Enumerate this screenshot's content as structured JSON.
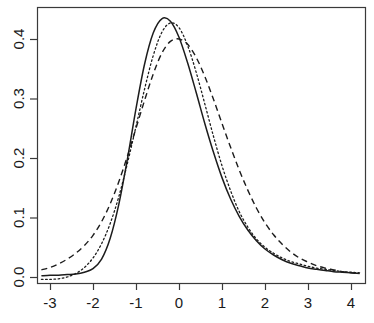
{
  "chart_data": {
    "type": "line",
    "title": "",
    "subtitle": "",
    "xlabel": "",
    "ylabel": "",
    "xlim": [
      -3.2,
      4.2
    ],
    "ylim": [
      -0.012,
      0.452
    ],
    "grid": false,
    "legend": null,
    "x_ticks": [
      "-3",
      "-2",
      "-1",
      "0",
      "1",
      "2",
      "3",
      "4"
    ],
    "x_tick_values": [
      -3,
      -2,
      -1,
      0,
      1,
      2,
      3,
      4
    ],
    "y_ticks": [
      "0.0",
      "0.1",
      "0.2",
      "0.3",
      "0.4"
    ],
    "y_tick_values": [
      0.0,
      0.1,
      0.2,
      0.3,
      0.4
    ],
    "x": [
      -3.2,
      -3.0,
      -2.8,
      -2.6,
      -2.4,
      -2.2,
      -2.0,
      -1.8,
      -1.6,
      -1.4,
      -1.2,
      -1.0,
      -0.8,
      -0.6,
      -0.4,
      -0.2,
      0.0,
      0.2,
      0.4,
      0.6,
      0.8,
      1.0,
      1.2,
      1.4,
      1.6,
      1.8,
      2.0,
      2.2,
      2.4,
      2.6,
      2.8,
      3.0,
      3.2,
      3.4,
      3.6,
      3.8,
      4.0,
      4.2
    ],
    "series": [
      {
        "name": "solid-curve",
        "style": "solid",
        "color": "#1c1c1c",
        "values": [
          0.002,
          0.003,
          0.003,
          0.004,
          0.005,
          0.008,
          0.014,
          0.03,
          0.065,
          0.122,
          0.198,
          0.283,
          0.358,
          0.41,
          0.434,
          0.43,
          0.403,
          0.36,
          0.31,
          0.258,
          0.21,
          0.167,
          0.131,
          0.102,
          0.079,
          0.061,
          0.047,
          0.037,
          0.029,
          0.023,
          0.019,
          0.015,
          0.013,
          0.011,
          0.009,
          0.008,
          0.007,
          0.006
        ]
      },
      {
        "name": "dashed-curve",
        "style": "dashed",
        "color": "#1c1c1c",
        "values": [
          0.012,
          0.016,
          0.022,
          0.03,
          0.04,
          0.053,
          0.07,
          0.093,
          0.123,
          0.16,
          0.203,
          0.25,
          0.297,
          0.341,
          0.376,
          0.396,
          0.4,
          0.391,
          0.369,
          0.337,
          0.299,
          0.258,
          0.218,
          0.18,
          0.146,
          0.116,
          0.091,
          0.071,
          0.055,
          0.042,
          0.032,
          0.025,
          0.019,
          0.015,
          0.012,
          0.009,
          0.007,
          0.006
        ]
      },
      {
        "name": "dotted-curve",
        "style": "dotted",
        "color": "#1c1c1c",
        "values": [
          -0.004,
          -0.004,
          -0.003,
          0.0,
          0.006,
          0.016,
          0.032,
          0.056,
          0.09,
          0.135,
          0.191,
          0.253,
          0.316,
          0.372,
          0.411,
          0.427,
          0.419,
          0.389,
          0.344,
          0.291,
          0.237,
          0.187,
          0.145,
          0.11,
          0.084,
          0.064,
          0.05,
          0.04,
          0.032,
          0.026,
          0.022,
          0.018,
          0.015,
          0.013,
          0.011,
          0.009,
          0.008,
          0.007
        ]
      }
    ]
  },
  "axes": {
    "box_left_px": 37,
    "box_right_px": 365,
    "box_top_px": 7,
    "box_bottom_px": 283
  }
}
